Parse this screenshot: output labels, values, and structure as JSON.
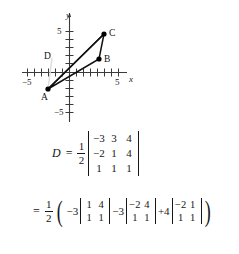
{
  "figure": {
    "type": "coordinate-plane-triangle",
    "axes": {
      "x_label": "x",
      "y_label": "y",
      "x_ticks_labeled": [
        {
          "value": -5,
          "label": "−5"
        },
        {
          "value": 5,
          "label": "5"
        }
      ],
      "y_ticks_labeled": [
        {
          "value": 5,
          "label": "5"
        },
        {
          "value": -5,
          "label": "−5"
        }
      ],
      "x_range": [
        -6,
        6
      ],
      "y_range": [
        -6,
        6
      ],
      "tick_interval": 1
    },
    "points": [
      {
        "name": "A",
        "label": "A",
        "x": -3,
        "y": -2,
        "label_pos": "below-left",
        "dot": true
      },
      {
        "name": "B",
        "label": "B",
        "x": 4,
        "y": 1.5,
        "label_pos": "right",
        "dot": true
      },
      {
        "name": "C",
        "label": "C",
        "x": 5,
        "y": 4.5,
        "label_pos": "right",
        "dot": true
      },
      {
        "name": "D",
        "label": "D",
        "x": -2.2,
        "y": 1.1,
        "label_pos": "center",
        "dot": false
      }
    ],
    "segments": [
      {
        "from": "A",
        "to": "B",
        "style": "solid"
      },
      {
        "from": "B",
        "to": "C",
        "style": "solid"
      },
      {
        "from": "C",
        "to": "A",
        "style": "solid"
      },
      {
        "from": "A",
        "to": "C",
        "style": "faint-guide"
      }
    ],
    "colors": {
      "axis": "#3a3a3a",
      "triangle": "#111111",
      "guide": "#c9c9c9",
      "point": "#000000"
    }
  },
  "math": {
    "line1": {
      "lhs": "D",
      "equals": "=",
      "fraction": {
        "numerator": "1",
        "denominator": "2"
      },
      "matrix": {
        "rows": [
          [
            "−3",
            "3",
            "4"
          ],
          [
            "−2",
            "1",
            "4"
          ],
          [
            "1",
            "1",
            "1"
          ]
        ]
      }
    },
    "line2": {
      "equals": "=",
      "fraction": {
        "numerator": "1",
        "denominator": "2"
      },
      "open_paren": "(",
      "close_paren": ")",
      "terms": [
        {
          "coefficient": "−3",
          "matrix": {
            "rows": [
              [
                "1",
                "4"
              ],
              [
                "1",
                "1"
              ]
            ]
          }
        },
        {
          "coefficient": "−3",
          "matrix": {
            "rows": [
              [
                "−2",
                "4"
              ],
              [
                "1",
                "1"
              ]
            ]
          }
        },
        {
          "coefficient": "+4",
          "matrix": {
            "rows": [
              [
                "−2",
                "1"
              ],
              [
                "1",
                "1"
              ]
            ]
          }
        }
      ]
    }
  }
}
